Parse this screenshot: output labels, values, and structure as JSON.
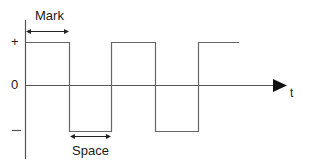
{
  "diagram": {
    "type": "digital-signal-waveform",
    "y_levels": {
      "high": "+",
      "zero": "0",
      "low": "—"
    },
    "x_axis_label": "t",
    "annotations": {
      "mark": "Mark",
      "space": "Space"
    },
    "colors": {
      "line": "#555555",
      "axis": "#444444",
      "arrow": "#111111",
      "text": "#1a1a1a"
    }
  }
}
